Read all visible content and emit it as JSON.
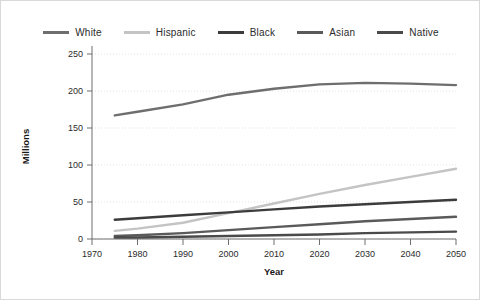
{
  "chart_data": {
    "type": "line",
    "title": "",
    "xlabel": "Year",
    "ylabel": "Millions",
    "xlim": [
      1970,
      2050
    ],
    "ylim": [
      0,
      250
    ],
    "grid": true,
    "legend_position": "top",
    "xticks": [
      "1970",
      "1980",
      "1990",
      "2000",
      "2010",
      "2020",
      "2030",
      "2040",
      "2050"
    ],
    "yticks": [
      "0",
      "50",
      "100",
      "150",
      "200",
      "250"
    ],
    "x": [
      1975,
      1980,
      1990,
      2000,
      2010,
      2020,
      2030,
      2040,
      2050
    ],
    "series": [
      {
        "name": "White",
        "color": "#6e6e6e",
        "values": [
          167,
          172,
          182,
          195,
          203,
          209,
          211,
          210,
          208
        ]
      },
      {
        "name": "Hispanic",
        "color": "#c4c4c4",
        "values": [
          11,
          14,
          22,
          35,
          48,
          61,
          73,
          84,
          95
        ]
      },
      {
        "name": "Black",
        "color": "#3c3c3c",
        "values": [
          26,
          28,
          32,
          36,
          40,
          44,
          47,
          50,
          53
        ]
      },
      {
        "name": "Asian",
        "color": "#5a5a5a",
        "values": [
          4,
          5,
          8,
          12,
          16,
          20,
          24,
          27,
          30
        ]
      },
      {
        "name": "Native",
        "color": "#4a4a4a",
        "values": [
          2,
          2,
          3,
          4,
          5,
          6,
          8,
          9,
          10
        ]
      }
    ]
  },
  "legend": {
    "items": [
      {
        "label": "White",
        "color": "#6e6e6e"
      },
      {
        "label": "Hispanic",
        "color": "#c4c4c4"
      },
      {
        "label": "Black",
        "color": "#3c3c3c"
      },
      {
        "label": "Asian",
        "color": "#5a5a5a"
      },
      {
        "label": "Native",
        "color": "#4a4a4a"
      }
    ]
  }
}
